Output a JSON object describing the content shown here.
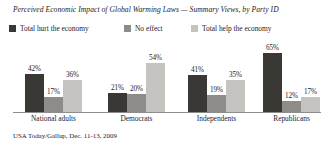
{
  "chart_data": {
    "type": "bar",
    "title": "Perceived Economic Impact of Global Warming Laws — Summary Views, by Party ID",
    "xlabel": "",
    "ylabel": "",
    "ylim": [
      0,
      100
    ],
    "grid": false,
    "legend_position": "top-left",
    "value_suffix": "%",
    "categories": [
      "National adults",
      "Democrats",
      "Independents",
      "Republicans"
    ],
    "series": [
      {
        "name": "Total hurt the economy",
        "color": "#3a3835",
        "values": [
          42,
          21,
          41,
          65
        ],
        "labels": [
          "42%",
          "21%",
          "41%",
          "65%"
        ]
      },
      {
        "name": "No effect",
        "color": "#8e8c88",
        "values": [
          17,
          20,
          19,
          12
        ],
        "labels": [
          "17%",
          "20%",
          "19%",
          "12%"
        ]
      },
      {
        "name": "Total help the economy",
        "color": "#c5c3bf",
        "values": [
          36,
          54,
          35,
          17
        ],
        "labels": [
          "36%",
          "54%",
          "35%",
          "17%"
        ]
      }
    ],
    "source": "USA Today/Gallup, Dec. 11-13, 2009"
  }
}
